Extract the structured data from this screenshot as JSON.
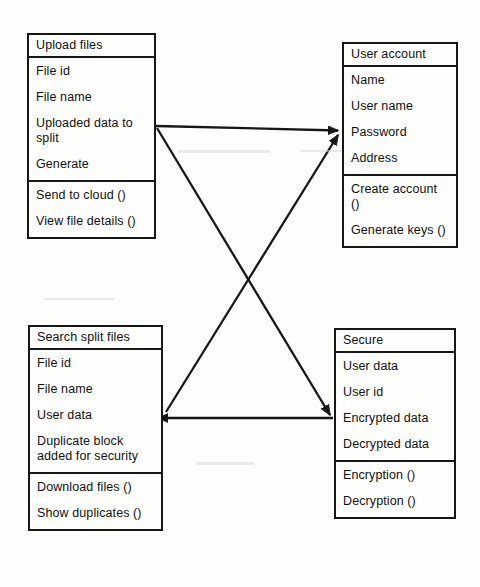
{
  "diagram": {
    "type": "uml-class-diagram",
    "title": "",
    "background_color": "#fdfdfb",
    "line_color": "#171717",
    "text_color": "#101010",
    "classes": [
      {
        "id": "upload-files",
        "name": "Upload files",
        "attributes": [
          "File id",
          "File name",
          "Uploaded data to split",
          "Generate"
        ],
        "operations": [
          "Send to cloud ()",
          "View file details ()"
        ]
      },
      {
        "id": "user-account",
        "name": "User account",
        "attributes": [
          "Name",
          "User name",
          "Password",
          "Address"
        ],
        "operations": [
          "Create account ()",
          "Generate keys ()"
        ]
      },
      {
        "id": "search-split-files",
        "name": "Search split files",
        "attributes": [
          "File id",
          "File name",
          "User data",
          "Duplicate block added for security"
        ],
        "operations": [
          "Download files ()",
          "Show duplicates ()"
        ]
      },
      {
        "id": "secure",
        "name": "Secure",
        "attributes": [
          "User data",
          "User id",
          "Encrypted data",
          "Decrypted data"
        ],
        "operations": [
          "Encryption ()",
          "Decryption ()"
        ]
      }
    ],
    "connectors": [
      {
        "id": "upload-to-user-account",
        "from": "upload-files",
        "to": "user-account",
        "style": "open-arrow",
        "x1": 156,
        "y1": 126,
        "x2": 341,
        "y2": 131
      },
      {
        "id": "upload-to-secure",
        "from": "upload-files",
        "to": "secure",
        "style": "open-arrow",
        "x1": 156,
        "y1": 127,
        "x2": 333,
        "y2": 417
      },
      {
        "id": "search-to-user-account",
        "from": "search-split-files",
        "to": "user-account",
        "style": "open-arrow",
        "x1": 166,
        "y1": 412,
        "x2": 341,
        "y2": 133
      },
      {
        "id": "secure-to-search",
        "from": "secure",
        "to": "search-split-files",
        "style": "open-arrow",
        "x1": 333,
        "y1": 418,
        "x2": 164,
        "y2": 418
      }
    ]
  }
}
